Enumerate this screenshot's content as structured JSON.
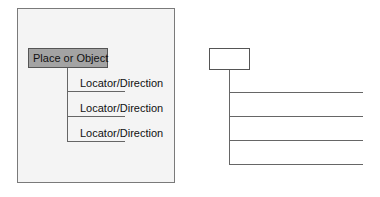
{
  "left_diagram": {
    "root_label": "Place or Object",
    "branches": [
      {
        "label": "Locator/Direction"
      },
      {
        "label": "Locator/Direction"
      },
      {
        "label": "Locator/Direction"
      }
    ],
    "colors": {
      "root_fill": "#a3a3a3",
      "panel_fill": "#f4f4f4",
      "line": "#666666"
    }
  },
  "right_diagram": {
    "root_label": "",
    "branches": [
      {
        "label": ""
      },
      {
        "label": ""
      },
      {
        "label": ""
      },
      {
        "label": ""
      }
    ]
  }
}
